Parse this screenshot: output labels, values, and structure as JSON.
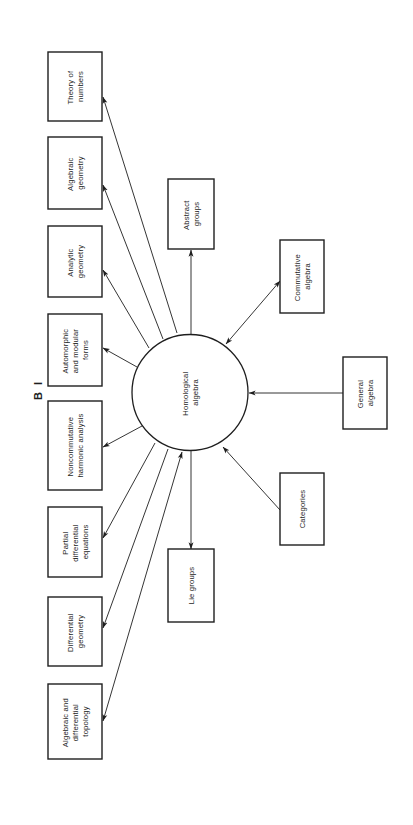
{
  "figure": {
    "label": "B I"
  },
  "hub": {
    "id": "homological-algebra",
    "lines": [
      "Homological",
      "algebra"
    ]
  },
  "nodes": [
    {
      "id": "theory-of-numbers",
      "lines": [
        "Theory of",
        "numbers"
      ]
    },
    {
      "id": "algebraic-geometry",
      "lines": [
        "Algebraic",
        "geometry"
      ]
    },
    {
      "id": "analytic-geometry",
      "lines": [
        "Analytic",
        "geometry"
      ]
    },
    {
      "id": "automorphic-modular-forms",
      "lines": [
        "Automorphic",
        "and modular",
        "forms"
      ]
    },
    {
      "id": "noncommutative-harmonic-analysis",
      "lines": [
        "Noncommutative",
        "harmonic  analysis"
      ]
    },
    {
      "id": "partial-differential-equations",
      "lines": [
        "Partial",
        "differential",
        "equations"
      ]
    },
    {
      "id": "differential-geometry",
      "lines": [
        "Differential",
        "geometry"
      ]
    },
    {
      "id": "algebraic-differential-topology",
      "lines": [
        "Algebraic and",
        "differential",
        "topology"
      ]
    },
    {
      "id": "abstract-groups",
      "lines": [
        "Abstract",
        "groups"
      ]
    },
    {
      "id": "lie-groups",
      "lines": [
        "Lie groups"
      ]
    },
    {
      "id": "commutative-algebra",
      "lines": [
        "Commutative",
        "algebra"
      ]
    },
    {
      "id": "general-algebra",
      "lines": [
        "General",
        "algebra"
      ]
    },
    {
      "id": "categories",
      "lines": [
        "Categories"
      ]
    }
  ],
  "edges": [
    {
      "from": "homological-algebra",
      "to": "theory-of-numbers",
      "direction": "forward"
    },
    {
      "from": "homological-algebra",
      "to": "algebraic-geometry",
      "direction": "forward"
    },
    {
      "from": "homological-algebra",
      "to": "analytic-geometry",
      "direction": "forward"
    },
    {
      "from": "homological-algebra",
      "to": "automorphic-modular-forms",
      "direction": "forward"
    },
    {
      "from": "homological-algebra",
      "to": "noncommutative-harmonic-analysis",
      "direction": "forward"
    },
    {
      "from": "homological-algebra",
      "to": "partial-differential-equations",
      "direction": "forward"
    },
    {
      "from": "homological-algebra",
      "to": "differential-geometry",
      "direction": "forward"
    },
    {
      "from": "homological-algebra",
      "to": "algebraic-differential-topology",
      "direction": "both"
    },
    {
      "from": "homological-algebra",
      "to": "abstract-groups",
      "direction": "forward"
    },
    {
      "from": "homological-algebra",
      "to": "lie-groups",
      "direction": "forward"
    },
    {
      "from": "homological-algebra",
      "to": "commutative-algebra",
      "direction": "both"
    },
    {
      "from": "general-algebra",
      "to": "homological-algebra",
      "direction": "forward"
    },
    {
      "from": "categories",
      "to": "homological-algebra",
      "direction": "forward"
    }
  ]
}
